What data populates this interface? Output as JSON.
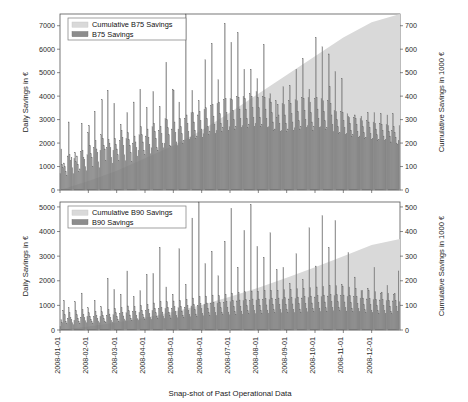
{
  "figure": {
    "width": 468,
    "height": 402,
    "background": "#ffffff",
    "xlabel": "Snap-shot of Past Operational Data",
    "colors": {
      "bar": "#8c8c8c",
      "bar_edge": "#6e6e6e",
      "cumulative_area": "#d9d9d9",
      "axis": "#555555",
      "text": "#1a1a1a"
    }
  },
  "chart_data": [
    {
      "type": "bar",
      "panel": "top",
      "title": "",
      "xlabel": "Snap-shot of Past Operational Data",
      "ylabel": "Daily Savings in €",
      "ylabel_right": "Cumulative Savings in 1000 €",
      "ylim": [
        0,
        7500
      ],
      "ylim_right": [
        0,
        750
      ],
      "yticks": [
        0,
        1000,
        2000,
        3000,
        4000,
        5000,
        6000,
        7000
      ],
      "yticks_right": [
        0,
        100,
        200,
        300,
        400,
        500,
        600,
        700
      ],
      "grid": false,
      "legend_position": "upper left",
      "legend": [
        "Cumulative B75 Savings",
        "B75 Savings"
      ],
      "x": [
        "2008-01-01",
        "2008-02-01",
        "2008-03-01",
        "2008-04-01",
        "2008-05-01",
        "2008-06-01",
        "2008-07-01",
        "2008-08-01",
        "2008-09-01",
        "2008-10-01",
        "2008-11-01",
        "2008-12-01"
      ],
      "xtick_labels": [
        "2008-01-01",
        "2008-02-01",
        "2008-03-01",
        "2008-04-01",
        "2008-05-01",
        "2008-06-01",
        "2008-07-01",
        "2008-08-01",
        "2008-09-01",
        "2008-10-01",
        "2008-11-01",
        "2008-12-01"
      ],
      "series": [
        {
          "name": "B75 Savings",
          "kind": "bar",
          "axis": "left",
          "units": "€ per day",
          "n_points": 366,
          "note": "Daily savings, strong weekly cycle (weekday peaks, weekend troughs), rising trend through the year",
          "values": [
            700,
            1750,
            1100,
            950,
            1150,
            1000,
            800,
            620,
            1450,
            2900,
            1500,
            1250,
            1400,
            950,
            700,
            1350,
            1600,
            1200,
            1450,
            1100,
            780,
            900,
            1650,
            2850,
            1700,
            1400,
            1300,
            1000,
            820,
            1500,
            2450,
            2750,
            1900,
            1550,
            1400,
            1000,
            1800,
            3350,
            2100,
            1750,
            1600,
            1200,
            950,
            1700,
            2350,
            3850,
            2200,
            1900,
            1750,
            1250,
            1800,
            4250,
            2150,
            2000,
            1800,
            1400,
            1150,
            1700,
            3700,
            2200,
            1950,
            1750,
            1500,
            1250,
            2100,
            2800,
            2550,
            2250,
            1900,
            1500,
            1250,
            2200,
            3300,
            2450,
            2150,
            1900,
            1600,
            1200,
            2000,
            3750,
            2300,
            2050,
            1800,
            1450,
            1700,
            2350,
            4300,
            2700,
            2350,
            2050,
            1700,
            1500,
            2300,
            3500,
            2600,
            2250,
            1950,
            1550,
            1800,
            2700,
            4200,
            2850,
            2500,
            2200,
            1800,
            1700,
            2550,
            3550,
            2700,
            2400,
            2000,
            1800,
            2000,
            3050,
            5450,
            3000,
            2650,
            2350,
            1900,
            1850,
            2600,
            4300,
            4250,
            2900,
            2450,
            2050,
            1900,
            2600,
            3750,
            3050,
            2700,
            2400,
            2000,
            2100,
            3050,
            7500,
            3200,
            2850,
            2500,
            2150,
            2250,
            3300,
            4250,
            3300,
            2900,
            2550,
            2200,
            2300,
            3200,
            3800,
            3350,
            2950,
            2600,
            2250,
            2400,
            3450,
            5550,
            3500,
            3050,
            2700,
            2350,
            2500,
            3600,
            6250,
            3650,
            3150,
            2800,
            2400,
            2550,
            3700,
            4700,
            3750,
            3250,
            2850,
            2500,
            2650,
            3850,
            7100,
            3900,
            3300,
            2950,
            2550,
            2700,
            3900,
            6300,
            3850,
            3400,
            3000,
            2600,
            2700,
            4000,
            6700,
            3950,
            3450,
            3050,
            2650,
            2750,
            4000,
            5150,
            3900,
            3450,
            3050,
            2650,
            2800,
            4100,
            5150,
            4000,
            3500,
            3100,
            2700,
            2850,
            4200,
            4750,
            3950,
            3500,
            3100,
            2700,
            2800,
            4000,
            6200,
            3950,
            3450,
            3050,
            2650,
            2700,
            3900,
            4100,
            3750,
            3300,
            2900,
            2550,
            2600,
            3800,
            3100,
            3650,
            3200,
            2850,
            2500,
            2550,
            3700,
            4400,
            3650,
            3200,
            2850,
            2500,
            2600,
            3800,
            4450,
            3700,
            3250,
            2900,
            2550,
            2650,
            3850,
            5150,
            3800,
            3350,
            2950,
            2600,
            2700,
            3950,
            5600,
            3900,
            3400,
            3000,
            2650,
            2750,
            3950,
            4300,
            3750,
            3300,
            2900,
            2550,
            2700,
            3900,
            6500,
            3950,
            3450,
            3050,
            2650,
            2700,
            3900,
            6100,
            3800,
            3350,
            2950,
            2600,
            2650,
            3800,
            5800,
            4400,
            3700,
            3200,
            2800,
            2500,
            3400,
            5050,
            3350,
            3000,
            2700,
            2400,
            2450,
            3350,
            4750,
            3300,
            2950,
            2650,
            2350,
            2400,
            3250,
            3150,
            3100,
            2850,
            2550,
            2300,
            2350,
            3100,
            3200,
            3050,
            2800,
            2500,
            2250,
            2300,
            3050,
            3150,
            2950,
            2700,
            2450,
            2200,
            2250,
            2950,
            3300,
            2900,
            2650,
            2400,
            2150,
            2200,
            2900,
            3300,
            2850,
            2600,
            2350,
            2100,
            2150,
            2850,
            3250,
            2800,
            2550,
            2300,
            2100,
            2150,
            2800,
            3200,
            2750,
            2500,
            2300,
            2050,
            2550,
            3250,
            2700,
            2450,
            2250,
            2000,
            1950,
            2100,
            2750
          ]
        },
        {
          "name": "Cumulative B75 Savings",
          "kind": "area",
          "axis": "right",
          "units": "1000 € cumulative",
          "note": "Monotonically increasing cumulative sum, ends near 750 thousand €",
          "x_monthly": [
            "2008-01-01",
            "2008-02-01",
            "2008-03-01",
            "2008-04-01",
            "2008-05-01",
            "2008-06-01",
            "2008-07-01",
            "2008-08-01",
            "2008-09-01",
            "2008-10-01",
            "2008-11-01",
            "2008-12-01",
            "2008-12-31"
          ],
          "values_monthly": [
            0,
            38,
            82,
            135,
            190,
            255,
            330,
            410,
            490,
            570,
            650,
            715,
            750
          ]
        }
      ]
    },
    {
      "type": "bar",
      "panel": "bottom",
      "title": "",
      "xlabel": "Snap-shot of Past Operational Data",
      "ylabel": "Daily Savings in €",
      "ylabel_right": "Cumulative Savings in 1000 €",
      "ylim": [
        0,
        5200
      ],
      "ylim_right": [
        0,
        520
      ],
      "yticks": [
        0,
        1000,
        2000,
        3000,
        4000,
        5000
      ],
      "yticks_right": [
        0,
        100,
        200,
        300,
        400,
        500
      ],
      "grid": false,
      "legend_position": "upper left",
      "legend": [
        "Cumulative B90 Savings",
        "B90 Savings"
      ],
      "x": [
        "2008-01-01",
        "2008-02-01",
        "2008-03-01",
        "2008-04-01",
        "2008-05-01",
        "2008-06-01",
        "2008-07-01",
        "2008-08-01",
        "2008-09-01",
        "2008-10-01",
        "2008-11-01",
        "2008-12-01"
      ],
      "xtick_labels": [
        "2008-01-01",
        "2008-02-01",
        "2008-03-01",
        "2008-04-01",
        "2008-05-01",
        "2008-06-01",
        "2008-07-01",
        "2008-08-01",
        "2008-09-01",
        "2008-10-01",
        "2008-11-01",
        "2008-12-01"
      ],
      "series": [
        {
          "name": "B90 Savings",
          "kind": "bar",
          "axis": "left",
          "units": "€ per day",
          "n_points": 366,
          "note": "Daily savings with weekly cycle, lower magnitude than B75, rising trend",
          "values": [
            150,
            420,
            300,
            800,
            1200,
            620,
            350,
            250,
            480,
            900,
            700,
            520,
            430,
            300,
            220,
            400,
            1150,
            800,
            620,
            480,
            350,
            280,
            520,
            1500,
            820,
            640,
            500,
            380,
            300,
            560,
            900,
            700,
            560,
            440,
            340,
            280,
            540,
            1200,
            760,
            600,
            480,
            370,
            300,
            560,
            950,
            740,
            590,
            460,
            350,
            300,
            600,
            2100,
            820,
            650,
            510,
            400,
            330,
            620,
            1650,
            880,
            700,
            550,
            430,
            360,
            680,
            1450,
            900,
            720,
            570,
            450,
            380,
            700,
            2400,
            980,
            780,
            610,
            480,
            400,
            740,
            1350,
            950,
            760,
            600,
            470,
            400,
            720,
            1600,
            1000,
            800,
            630,
            500,
            420,
            780,
            2250,
            1050,
            840,
            660,
            520,
            440,
            800,
            2300,
            1100,
            880,
            700,
            550,
            470,
            860,
            3350,
            1150,
            920,
            730,
            570,
            480,
            880,
            1750,
            1150,
            920,
            730,
            580,
            490,
            880,
            1450,
            1180,
            940,
            750,
            590,
            500,
            900,
            3300,
            1200,
            960,
            770,
            600,
            510,
            920,
            1850,
            1250,
            1000,
            800,
            630,
            540,
            980,
            4550,
            1300,
            1040,
            830,
            650,
            560,
            1000,
            5200,
            1350,
            1080,
            860,
            680,
            580,
            1050,
            2700,
            1380,
            1100,
            880,
            700,
            590,
            1080,
            3200,
            1420,
            1130,
            900,
            710,
            600,
            1100,
            2200,
            1400,
            1120,
            900,
            710,
            620,
            1120,
            3600,
            1450,
            1160,
            930,
            730,
            620,
            1150,
            4950,
            1500,
            1200,
            960,
            750,
            640,
            1180,
            2550,
            1520,
            1220,
            970,
            770,
            650,
            1200,
            4050,
            1550,
            1240,
            990,
            780,
            660,
            1200,
            5100,
            1580,
            1260,
            1000,
            790,
            670,
            1220,
            3400,
            1580,
            1260,
            1010,
            800,
            680,
            1230,
            2950,
            1600,
            1280,
            1020,
            810,
            690,
            1240,
            3950,
            1620,
            1300,
            1040,
            820,
            700,
            1250,
            2450,
            1620,
            1300,
            1040,
            820,
            700,
            1250,
            2550,
            1640,
            1310,
            1050,
            830,
            710,
            1260,
            1900,
            1650,
            1320,
            1060,
            840,
            720,
            1280,
            3100,
            1680,
            1340,
            1080,
            850,
            730,
            1300,
            2050,
            1700,
            1360,
            1090,
            860,
            740,
            1320,
            4150,
            1720,
            1380,
            1100,
            870,
            750,
            1340,
            2600,
            1750,
            1400,
            1120,
            890,
            760,
            1360,
            4650,
            1780,
            1420,
            1140,
            900,
            770,
            1380,
            3350,
            1800,
            1440,
            1150,
            910,
            780,
            1400,
            4450,
            1800,
            1440,
            1150,
            910,
            780,
            1390,
            1850,
            1780,
            1420,
            1140,
            900,
            770,
            1370,
            3150,
            1750,
            1400,
            1120,
            890,
            760,
            1350,
            2150,
            1700,
            1360,
            1090,
            860,
            740,
            1300,
            1600,
            1620,
            1300,
            1040,
            820,
            710,
            1260,
            1700,
            1600,
            1280,
            1030,
            810,
            700,
            1240,
            2550,
            1560,
            1250,
            1000,
            790,
            680,
            1220,
            1500,
            1540,
            1230,
            990,
            780,
            670,
            1200,
            1820,
            1500,
            1200,
            970,
            760,
            660,
            1180,
            1450,
            1480,
            1190,
            950,
            750,
            2400,
            1150
          ]
        },
        {
          "name": "Cumulative B90 Savings",
          "kind": "area",
          "axis": "right",
          "units": "1000 € cumulative",
          "note": "Monotonically increasing cumulative sum, ends near 370 thousand €",
          "x_monthly": [
            "2008-01-01",
            "2008-02-01",
            "2008-03-01",
            "2008-04-01",
            "2008-05-01",
            "2008-06-01",
            "2008-07-01",
            "2008-08-01",
            "2008-09-01",
            "2008-10-01",
            "2008-11-01",
            "2008-12-01",
            "2008-12-31"
          ],
          "values_monthly": [
            0,
            14,
            30,
            50,
            74,
            102,
            135,
            172,
            212,
            255,
            300,
            345,
            370
          ]
        }
      ]
    }
  ]
}
